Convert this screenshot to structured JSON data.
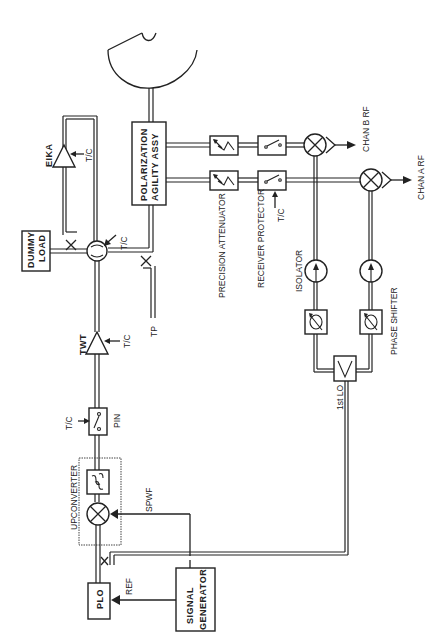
{
  "diagram": {
    "type": "block-diagram",
    "orientation": "rotated-90-ccw",
    "components": {
      "antenna": "parabolic-antenna",
      "polarization": {
        "line1": "POLARIZATION",
        "line2": "AGILITY  ASSY"
      },
      "eika": "EIKA",
      "dummy_load": {
        "line1": "DUMMY",
        "line2": "LOAD"
      },
      "twt": "TWT",
      "pin": "PIN",
      "upconverter": "UPCONVERTER",
      "plo": "PLO",
      "signal_generator": {
        "line1": "SIGNAL",
        "line2": "GENERATOR"
      },
      "precision_attenuator": "PRECISION ATTENUATOR",
      "receiver_protector": "RECEIVER PROTECTOR",
      "isolator": "ISOLATOR",
      "phase_shifter": "PHASE SHIFTER",
      "first_lo": "1st LO",
      "chan_b_rf": "CHAN B RF",
      "chan_a_rf": "CHAN A RF"
    },
    "signals": {
      "tc": "T/C",
      "tp": "TP",
      "ref": "REF",
      "spwf": "SPWF"
    }
  }
}
